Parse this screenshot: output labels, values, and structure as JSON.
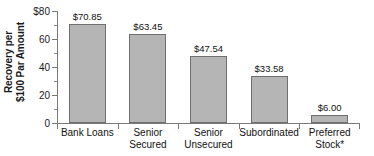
{
  "chart_data": {
    "type": "bar",
    "title": "",
    "xlabel": "",
    "ylabel_line1": "Recovery per",
    "ylabel_line2": "$100 Par Amount",
    "categories": [
      "Bank Loans",
      "Senior Secured",
      "Senior Unsecured",
      "Subordinated",
      "Preferred Stock*"
    ],
    "category_lines": [
      [
        "Bank Loans"
      ],
      [
        "Senior",
        "Secured"
      ],
      [
        "Senior",
        "Unsecured"
      ],
      [
        "Subordinated"
      ],
      [
        "Preferred",
        "Stock*"
      ]
    ],
    "values": [
      70.85,
      63.45,
      47.54,
      33.58,
      6.0
    ],
    "value_labels": [
      "$70.85",
      "$63.45",
      "$47.54",
      "$33.58",
      "$6.00"
    ],
    "ylim": [
      0,
      80
    ],
    "yticks": [
      0,
      20,
      40,
      60,
      80
    ],
    "ytick_labels": [
      "0",
      "20",
      "40",
      "60",
      "$80"
    ],
    "yticks_minor": [
      10,
      30,
      50,
      70
    ],
    "grid": false,
    "legend": "none",
    "bar_color": "#b5b5b5",
    "bar_edge_color": "#6f6f6f",
    "axis_color": "#7a7a7a",
    "text_color": "#111111"
  }
}
